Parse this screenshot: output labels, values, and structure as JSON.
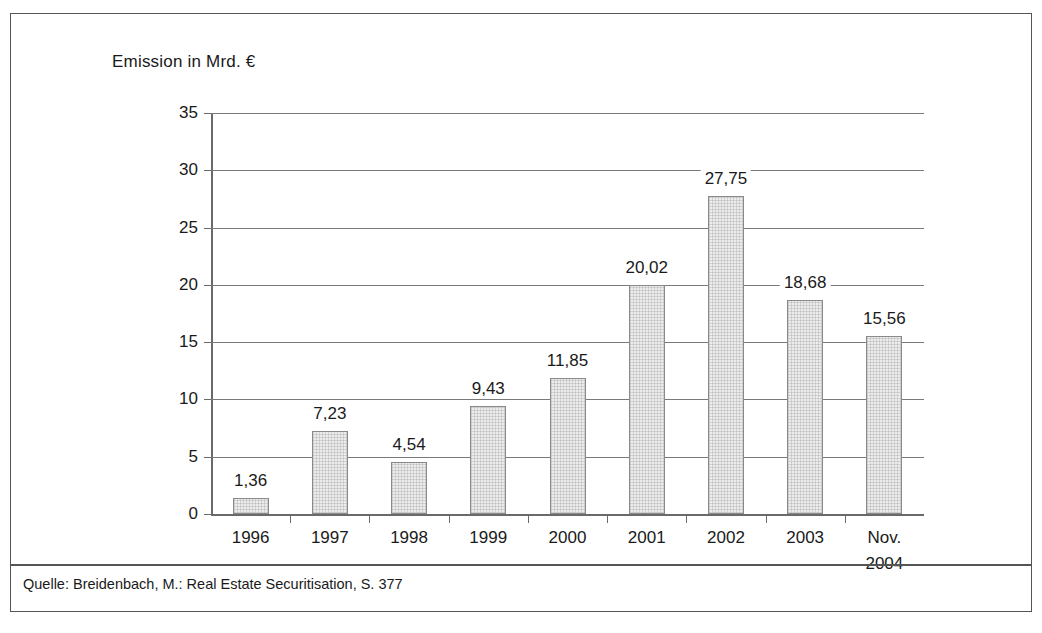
{
  "figure": {
    "axis_title": "Emission in Mrd. €",
    "source_note": "Quelle: Breidenbach, M.: Real Estate Securitisation, S. 377"
  },
  "chart_data": {
    "type": "bar",
    "title": "Emission in Mrd. €",
    "xlabel": "",
    "ylabel": "Emission in Mrd. €",
    "categories": [
      "1996",
      "1997",
      "1998",
      "1999",
      "2000",
      "2001",
      "2002",
      "2003",
      "Nov.\n2004"
    ],
    "values": [
      1.36,
      7.23,
      4.54,
      9.43,
      11.85,
      20.02,
      27.75,
      18.68,
      15.56
    ],
    "value_labels": [
      "1,36",
      "7,23",
      "4,54",
      "9,43",
      "11,85",
      "20,02",
      "27,75",
      "18,68",
      "15,56"
    ],
    "ylim": [
      0,
      35
    ],
    "yticks": [
      0,
      5,
      10,
      15,
      20,
      25,
      30,
      35
    ],
    "ytick_labels": [
      "0",
      "5",
      "10",
      "15",
      "20",
      "25",
      "30",
      "35"
    ],
    "grid": true,
    "legend": false,
    "bar_fill_color": "#ececec",
    "bar_border_color": "#8a8a8a",
    "axis_color": "#6a6a6a",
    "text_color": "#1a1a1a"
  }
}
